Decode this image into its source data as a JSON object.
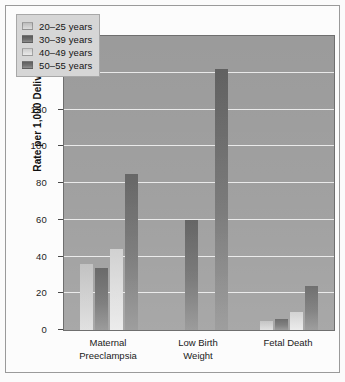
{
  "chart_data": {
    "type": "bar",
    "title": "",
    "subtitle": "",
    "xlabel": "",
    "ylabel": "Rate per 1,000 Deliveries",
    "ylim": [
      0,
      160
    ],
    "yticks": [
      0,
      20,
      40,
      60,
      80,
      100,
      120,
      140,
      160
    ],
    "grid": true,
    "legend_position": "top-left",
    "categories": [
      "Maternal\nPreeclampsia",
      "Low Birth\nWeight",
      "Fetal Death"
    ],
    "series": [
      {
        "name": "20–25 years",
        "color": "#cfcfcf",
        "values": [
          36,
          0,
          5
        ]
      },
      {
        "name": "30–39 years",
        "color": "#6e6e6e",
        "values": [
          34,
          60,
          6
        ]
      },
      {
        "name": "40–49 years",
        "color": "#dedede",
        "values": [
          44,
          0,
          10
        ]
      },
      {
        "name": "50–55 years",
        "color": "#737373",
        "values": [
          85,
          142,
          24
        ]
      }
    ]
  },
  "figure": {
    "background_color": "#fbfbfb",
    "plot_background_color": "#9b9b9b",
    "gridline_color": "#f0f0f0",
    "frame_border_color": "#9a9a9a"
  }
}
